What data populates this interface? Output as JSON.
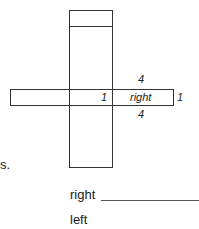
{
  "net": {
    "labels": {
      "top": "4",
      "center": "1",
      "right_face": "right",
      "right_edge": "1",
      "bottom": "4"
    }
  },
  "margin_text": "s.",
  "answers": [
    {
      "label": "right",
      "value": ""
    },
    {
      "label": "left",
      "value": ""
    }
  ]
}
